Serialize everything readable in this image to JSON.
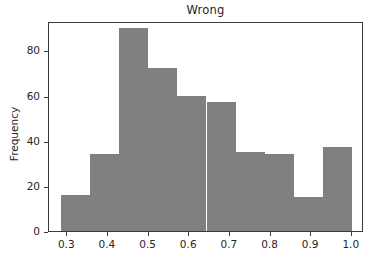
{
  "chart_data": {
    "type": "bar",
    "subtype": "histogram",
    "title": "Wrong",
    "xlabel": "",
    "ylabel": "Frequency",
    "xlim": [
      0.255,
      1.03
    ],
    "ylim": [
      0,
      93
    ],
    "grid": false,
    "legend": null,
    "bar_color": "#808080",
    "axis_color": "#3b3b3b",
    "text_color": "#262626",
    "background": "#ffffff",
    "xticks": [
      0.3,
      0.4,
      0.5,
      0.6,
      0.7,
      0.8,
      0.9,
      1.0
    ],
    "xtick_labels": [
      "0.3",
      "0.4",
      "0.5",
      "0.6",
      "0.7",
      "0.8",
      "0.9",
      "1.0"
    ],
    "yticks": [
      0,
      20,
      40,
      60,
      80
    ],
    "ytick_labels": [
      "0",
      "20",
      "40",
      "60",
      "80"
    ],
    "bin_edges": [
      0.285,
      0.3565,
      0.428,
      0.4995,
      0.571,
      0.6425,
      0.714,
      0.7855,
      0.857,
      0.9285,
      1.0
    ],
    "bins": [
      {
        "x0": 0.285,
        "x1": 0.3565,
        "value": 16
      },
      {
        "x0": 0.3565,
        "x1": 0.428,
        "value": 34
      },
      {
        "x0": 0.428,
        "x1": 0.4995,
        "value": 90
      },
      {
        "x0": 0.4995,
        "x1": 0.571,
        "value": 72
      },
      {
        "x0": 0.571,
        "x1": 0.6425,
        "value": 60
      },
      {
        "x0": 0.6425,
        "x1": 0.714,
        "value": 57
      },
      {
        "x0": 0.714,
        "x1": 0.7855,
        "value": 35
      },
      {
        "x0": 0.7855,
        "x1": 0.857,
        "value": 34
      },
      {
        "x0": 0.857,
        "x1": 0.9285,
        "value": 15
      },
      {
        "x0": 0.9285,
        "x1": 1.0,
        "value": 37
      }
    ],
    "categories": [
      "0.285-0.357",
      "0.357-0.428",
      "0.428-0.500",
      "0.500-0.571",
      "0.571-0.643",
      "0.643-0.714",
      "0.714-0.786",
      "0.786-0.857",
      "0.857-0.929",
      "0.929-1.000"
    ],
    "values": [
      16,
      34,
      90,
      72,
      60,
      57,
      35,
      34,
      15,
      37
    ]
  }
}
